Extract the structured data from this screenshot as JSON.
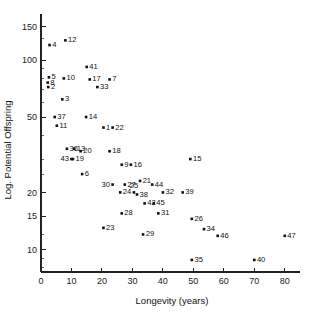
{
  "chart_data": {
    "type": "scatter",
    "title": "",
    "xlabel": "Longevity (years)",
    "ylabel": "Log. Potential Offspring",
    "xscale": "linear",
    "yscale": "log",
    "xlim": [
      0,
      85
    ],
    "ylim": [
      7.6,
      175
    ],
    "grid": false,
    "legend": false,
    "xticks": [
      0,
      10,
      20,
      30,
      40,
      50,
      60,
      70,
      80
    ],
    "xtick_labels": [
      "0",
      "10",
      "20",
      "30",
      "40",
      "50",
      "60",
      "70",
      "80"
    ],
    "yticks": [
      150,
      100,
      50,
      20,
      15,
      10
    ],
    "ytick_labels": [
      "150",
      "100",
      "50",
      "20",
      "15",
      "10"
    ],
    "yminor_ticks": [
      130,
      90,
      80,
      70,
      60,
      40,
      30,
      25,
      12,
      9,
      8
    ],
    "marker": "square",
    "marker_color": "#101010",
    "points": [
      {
        "id": "1",
        "x": 20.5,
        "y": 44,
        "label_pos": "right"
      },
      {
        "id": "2",
        "x": 2.4,
        "y": 72,
        "label_pos": "right"
      },
      {
        "id": "3",
        "x": 7.0,
        "y": 62,
        "label_pos": "right"
      },
      {
        "id": "4",
        "x": 2.8,
        "y": 120,
        "label_pos": "right"
      },
      {
        "id": "5",
        "x": 2.6,
        "y": 81,
        "label_pos": "right"
      },
      {
        "id": "6",
        "x": 13.5,
        "y": 25,
        "label_pos": "right"
      },
      {
        "id": "7",
        "x": 22.5,
        "y": 79,
        "label_pos": "right"
      },
      {
        "id": "8",
        "x": 2.2,
        "y": 76,
        "label_pos": "right"
      },
      {
        "id": "9",
        "x": 26.5,
        "y": 28,
        "label_pos": "right"
      },
      {
        "id": "10",
        "x": 7.5,
        "y": 80,
        "label_pos": "right"
      },
      {
        "id": "11",
        "x": 5.2,
        "y": 45,
        "label_pos": "right"
      },
      {
        "id": "12",
        "x": 8.0,
        "y": 127,
        "label_pos": "right"
      },
      {
        "id": "13",
        "x": 10.9,
        "y": 34,
        "label_pos": "right"
      },
      {
        "id": "14",
        "x": 14.8,
        "y": 50,
        "label_pos": "right"
      },
      {
        "id": "15",
        "x": 49.0,
        "y": 30,
        "label_pos": "right"
      },
      {
        "id": "16",
        "x": 29.5,
        "y": 28,
        "label_pos": "right"
      },
      {
        "id": "17",
        "x": 16.0,
        "y": 79,
        "label_pos": "right"
      },
      {
        "id": "18",
        "x": 22.5,
        "y": 33,
        "label_pos": "right"
      },
      {
        "id": "19",
        "x": 10.5,
        "y": 30,
        "label_pos": "right"
      },
      {
        "id": "20",
        "x": 13.0,
        "y": 33,
        "label_pos": "right"
      },
      {
        "id": "21",
        "x": 32.5,
        "y": 23,
        "label_pos": "right"
      },
      {
        "id": "22",
        "x": 23.5,
        "y": 44,
        "label_pos": "right"
      },
      {
        "id": "23",
        "x": 20.5,
        "y": 13,
        "label_pos": "right"
      },
      {
        "id": "24",
        "x": 26.0,
        "y": 20,
        "label_pos": "right"
      },
      {
        "id": "25",
        "x": 30.5,
        "y": 20,
        "label_pos": "above"
      },
      {
        "id": "26",
        "x": 49.5,
        "y": 14.5,
        "label_pos": "right"
      },
      {
        "id": "27",
        "x": 27.5,
        "y": 22,
        "label_pos": "right"
      },
      {
        "id": "28",
        "x": 26.5,
        "y": 15.5,
        "label_pos": "right"
      },
      {
        "id": "29",
        "x": 33.5,
        "y": 12,
        "label_pos": "right"
      },
      {
        "id": "30",
        "x": 23.5,
        "y": 22,
        "label_pos": "left"
      },
      {
        "id": "31",
        "x": 38.5,
        "y": 15.5,
        "label_pos": "right"
      },
      {
        "id": "32",
        "x": 40.0,
        "y": 20,
        "label_pos": "right"
      },
      {
        "id": "33",
        "x": 18.5,
        "y": 72,
        "label_pos": "right"
      },
      {
        "id": "34",
        "x": 53.5,
        "y": 12.8,
        "label_pos": "right"
      },
      {
        "id": "35",
        "x": 49.5,
        "y": 8.8,
        "label_pos": "right"
      },
      {
        "id": "36",
        "x": 8.5,
        "y": 34,
        "label_pos": "right"
      },
      {
        "id": "37",
        "x": 4.5,
        "y": 50,
        "label_pos": "right"
      },
      {
        "id": "38",
        "x": 31.5,
        "y": 19.5,
        "label_pos": "right"
      },
      {
        "id": "39",
        "x": 46.5,
        "y": 20,
        "label_pos": "right"
      },
      {
        "id": "40",
        "x": 70.0,
        "y": 8.8,
        "label_pos": "right"
      },
      {
        "id": "41",
        "x": 15.0,
        "y": 92,
        "label_pos": "right"
      },
      {
        "id": "42",
        "x": 34.0,
        "y": 17.5,
        "label_pos": "right"
      },
      {
        "id": "43",
        "x": 10.0,
        "y": 30,
        "label_pos": "left"
      },
      {
        "id": "44",
        "x": 36.5,
        "y": 22,
        "label_pos": "right"
      },
      {
        "id": "45",
        "x": 37.0,
        "y": 17.5,
        "label_pos": "right"
      },
      {
        "id": "46",
        "x": 58.0,
        "y": 11.8,
        "label_pos": "right"
      },
      {
        "id": "47",
        "x": 80.0,
        "y": 11.8,
        "label_pos": "right"
      }
    ]
  }
}
